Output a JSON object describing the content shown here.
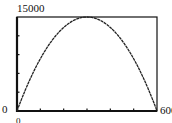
{
  "chart_data": {
    "type": "line",
    "title": "",
    "xlabel": "",
    "ylabel": "",
    "xlim": [
      0,
      600
    ],
    "ylim": [
      0,
      15000
    ],
    "x_tick_step": 100,
    "y_tick_step": 3000,
    "grid": false,
    "legend": null,
    "tick_labels": {
      "x_min": "0",
      "x_max": "600",
      "y_min": "0",
      "y_max": "15000"
    },
    "series": [
      {
        "name": "parabola",
        "x": [
          0,
          50,
          100,
          150,
          200,
          250,
          300,
          350,
          400,
          450,
          500,
          550,
          600
        ],
        "y": [
          0,
          4583,
          8333,
          11250,
          13333,
          14583,
          15000,
          14583,
          13333,
          11250,
          8333,
          4583,
          0
        ]
      }
    ]
  },
  "labels": {
    "ymax": "15000",
    "ymin": "0",
    "xmin": "0",
    "xmax": "600"
  },
  "colors": {
    "frame": "#111111",
    "curve": "#222222",
    "background": "#ffffff"
  }
}
